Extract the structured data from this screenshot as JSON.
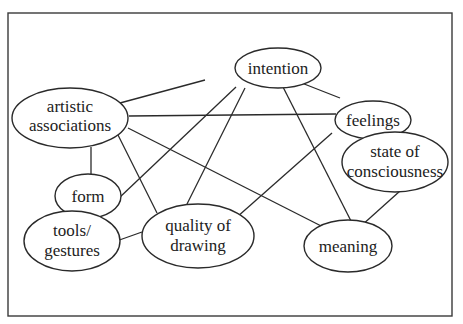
{
  "diagram": {
    "type": "concept-network",
    "nodes": [
      {
        "id": "intention",
        "lines": [
          "intention"
        ]
      },
      {
        "id": "artistic-associations",
        "lines": [
          "artistic",
          "associations"
        ]
      },
      {
        "id": "feelings",
        "lines": [
          "feelings"
        ]
      },
      {
        "id": "state-of-consciousness",
        "lines": [
          "state of",
          "consciousness"
        ]
      },
      {
        "id": "form",
        "lines": [
          "form"
        ]
      },
      {
        "id": "tools-gestures",
        "lines": [
          "tools/",
          "gestures"
        ]
      },
      {
        "id": "quality-of-drawing",
        "lines": [
          "quality of",
          "drawing"
        ]
      },
      {
        "id": "meaning",
        "lines": [
          "meaning"
        ]
      }
    ],
    "edges": [
      [
        "intention",
        "artistic-associations"
      ],
      [
        "intention",
        "form"
      ],
      [
        "intention",
        "quality-of-drawing"
      ],
      [
        "intention",
        "feelings"
      ],
      [
        "intention",
        "meaning"
      ],
      [
        "artistic-associations",
        "feelings"
      ],
      [
        "artistic-associations",
        "quality-of-drawing"
      ],
      [
        "artistic-associations",
        "meaning"
      ],
      [
        "artistic-associations",
        "form"
      ],
      [
        "feelings",
        "state-of-consciousness"
      ],
      [
        "feelings",
        "quality-of-drawing"
      ],
      [
        "state-of-consciousness",
        "meaning"
      ],
      [
        "form",
        "tools-gestures"
      ],
      [
        "tools-gestures",
        "quality-of-drawing"
      ]
    ]
  },
  "labels": {
    "intention": "intention",
    "artistic_1": "artistic",
    "artistic_2": "associations",
    "feelings": "feelings",
    "state_1": "state of",
    "state_2": "consciousness",
    "form": "form",
    "tools_1": "tools/",
    "tools_2": "gestures",
    "quality_1": "quality of",
    "quality_2": "drawing",
    "meaning": "meaning"
  }
}
